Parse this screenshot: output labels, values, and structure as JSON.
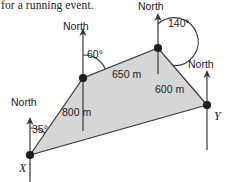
{
  "caption": {
    "text": "for a running event."
  },
  "figure": {
    "type": "bearing-diagram",
    "fill_color": "#d6d6d6",
    "stroke_color": "#3a3a3a",
    "vertex_color": "#1d1d1d",
    "vertices": [
      {
        "name": "X",
        "label": "X",
        "x": 30,
        "y": 155,
        "label_x": 19,
        "label_y": 172,
        "bearing_label": "35°",
        "north_label": "North"
      },
      {
        "name": "A",
        "label": "",
        "x": 83,
        "y": 78,
        "bearing_label": "60°",
        "north_label": "North"
      },
      {
        "name": "B",
        "label": "",
        "x": 158,
        "y": 48,
        "bearing_label": "140°",
        "north_label": "North"
      },
      {
        "name": "Y",
        "label": "Y",
        "x": 207,
        "y": 105,
        "label_x": 214,
        "label_y": 120,
        "bearing_label": "",
        "north_label": "North"
      }
    ],
    "north_labels": [
      {
        "for": "X",
        "text": "North",
        "x": 11,
        "y": 106
      },
      {
        "for": "A",
        "text": "North",
        "x": 63,
        "y": 30
      },
      {
        "for": "B",
        "text": "North",
        "x": 138,
        "y": 10
      },
      {
        "for": "Y",
        "text": "North",
        "x": 188,
        "y": 68
      }
    ],
    "angle_labels": [
      {
        "text": "35°",
        "x": 32,
        "y": 133
      },
      {
        "text": "60°",
        "x": 87,
        "y": 58
      },
      {
        "text": "140°",
        "x": 168,
        "y": 27
      }
    ],
    "side_labels": [
      {
        "text": "800 m",
        "x": 62,
        "y": 116,
        "from": "X",
        "to": "A"
      },
      {
        "text": "650 m",
        "x": 112,
        "y": 78,
        "from": "A",
        "to": "B"
      },
      {
        "text": "600 m",
        "x": 155,
        "y": 93,
        "from": "B",
        "to": "Y"
      }
    ]
  }
}
